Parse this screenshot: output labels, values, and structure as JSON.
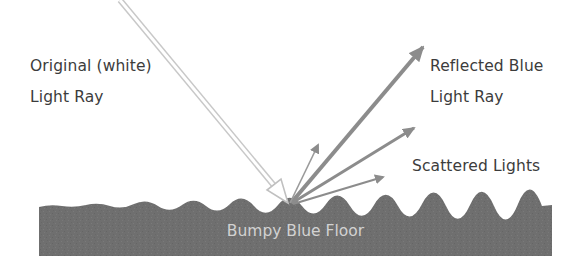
{
  "diagram": {
    "labels": {
      "original_ray": [
        "Original (white)",
        "Light Ray"
      ],
      "reflected_ray": [
        "Reflected Blue",
        "Light Ray"
      ],
      "scattered": "Scattered Lights",
      "floor": "Bumpy Blue Floor"
    },
    "colors": {
      "background": "#ffffff",
      "floor": "#6f6f6f",
      "floor_text": "#d2d2d2",
      "ray_gray": "#8c8c8c",
      "incoming_outline": "#c8c8c8",
      "incoming_fill": "#ffffff",
      "text": "#3c3c3c"
    },
    "elements": [
      {
        "name": "incoming-ray",
        "from": [
          120,
          0
        ],
        "to": [
          288,
          203
        ],
        "style": "hollow-double-line"
      },
      {
        "name": "reflected-ray",
        "from": [
          291,
          203
        ],
        "to": [
          423,
          47
        ],
        "style": "thick"
      },
      {
        "name": "scattered-ray-upper",
        "from": [
          292,
          203
        ],
        "to": [
          414,
          128
        ],
        "style": "medium"
      },
      {
        "name": "scattered-ray-lower",
        "from": [
          293,
          204
        ],
        "to": [
          383,
          177
        ],
        "style": "thin"
      },
      {
        "name": "scattered-ray-small",
        "from": [
          290,
          203
        ],
        "to": [
          318,
          145
        ],
        "style": "thin"
      }
    ]
  }
}
